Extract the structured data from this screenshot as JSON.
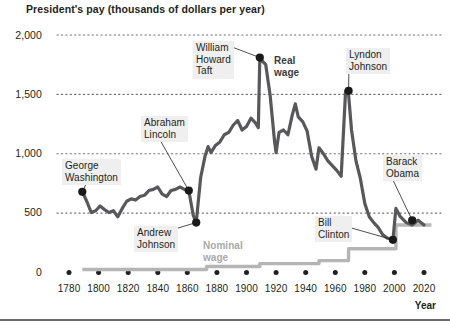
{
  "chart_data": {
    "type": "line",
    "title": "President's pay (thousands of dollars per year)",
    "xlabel": "Year",
    "ylabel": "",
    "xlim": [
      1780,
      2025
    ],
    "ylim": [
      0,
      2100
    ],
    "grid": "horizontal dotted",
    "legend": "inline annotations",
    "y_ticks": [
      "0",
      "500",
      "1,000",
      "1,500",
      "2,000"
    ],
    "y_tick_values": [
      0,
      500,
      1000,
      1500,
      2000
    ],
    "x_ticks": [
      "1780",
      "1800",
      "1820",
      "1840",
      "1860",
      "1880",
      "1900",
      "1920",
      "1940",
      "1960",
      "1980",
      "2000",
      "2020"
    ],
    "x_tick_values": [
      1780,
      1800,
      1820,
      1840,
      1860,
      1880,
      1900,
      1920,
      1940,
      1960,
      1980,
      2000,
      2020
    ],
    "series": [
      {
        "name": "Real wage",
        "color": "#58585a",
        "x": [
          1789,
          1792,
          1795,
          1798,
          1801,
          1804,
          1807,
          1810,
          1813,
          1816,
          1819,
          1822,
          1825,
          1828,
          1831,
          1834,
          1837,
          1840,
          1843,
          1846,
          1849,
          1852,
          1855,
          1858,
          1861,
          1864,
          1866,
          1869,
          1872,
          1874,
          1876,
          1879,
          1882,
          1885,
          1888,
          1891,
          1894,
          1897,
          1900,
          1903,
          1906,
          1908,
          1909,
          1910,
          1913,
          1916,
          1919,
          1920,
          1922,
          1925,
          1928,
          1931,
          1933,
          1935,
          1938,
          1941,
          1944,
          1947,
          1949,
          1952,
          1955,
          1958,
          1961,
          1964,
          1967,
          1969,
          1971,
          1974,
          1977,
          1980,
          1983,
          1986,
          1989,
          1992,
          1995,
          1999,
          2001,
          2004,
          2008,
          2012,
          2016,
          2020
        ],
        "values": [
          680,
          600,
          505,
          520,
          560,
          530,
          505,
          520,
          470,
          540,
          600,
          620,
          610,
          640,
          650,
          690,
          700,
          720,
          660,
          640,
          690,
          700,
          720,
          700,
          690,
          480,
          420,
          800,
          980,
          1060,
          1010,
          1070,
          1100,
          1160,
          1180,
          1240,
          1280,
          1200,
          1230,
          1300,
          1260,
          1220,
          1810,
          1790,
          1750,
          1490,
          1100,
          1010,
          1180,
          1200,
          1160,
          1330,
          1420,
          1310,
          1270,
          1190,
          980,
          870,
          1050,
          1000,
          940,
          900,
          860,
          810,
          1530,
          1500,
          1200,
          940,
          790,
          580,
          470,
          420,
          380,
          320,
          290,
          275,
          540,
          470,
          420,
          400,
          440,
          400
        ]
      },
      {
        "name": "Nominal wage",
        "color": "#b5b5b5",
        "step_years": [
          1789,
          1873,
          1909,
          1949,
          1969,
          2001,
          2025
        ],
        "step_values": [
          25,
          50,
          75,
          100,
          200,
          400,
          400
        ]
      }
    ],
    "annotations": [
      {
        "id": "george-washington",
        "label": "George\nWashington",
        "year": 1789,
        "value": 680
      },
      {
        "id": "andrew-johnson",
        "label": "Andrew\nJohnson",
        "year": 1866,
        "value": 420
      },
      {
        "id": "abraham-lincoln",
        "label": "Abraham\nLincoln",
        "year": 1861,
        "value": 690
      },
      {
        "id": "william-howard-taft",
        "label": "William\nHoward\nTaft",
        "year": 1909,
        "value": 1810
      },
      {
        "id": "lyndon-johnson",
        "label": "Lyndon\nJohnson",
        "year": 1969,
        "value": 1530
      },
      {
        "id": "bill-clinton",
        "label": "Bill\nClinton",
        "year": 1999,
        "value": 275
      },
      {
        "id": "barack-obama",
        "label": "Barack\nObama",
        "year": 2012,
        "value": 440
      }
    ],
    "series_labels": [
      {
        "id": "real-wage-label",
        "text": "Real\nwage",
        "color": "#3a3a3a"
      },
      {
        "id": "nominal-wage-label",
        "text": "Nominal\nwage",
        "color": "#a9a9a9"
      }
    ],
    "colors": {
      "real_wage": "#58585a",
      "nominal_wage": "#b5b5b5",
      "gridline": "#6f6f6f",
      "callout_bg": "#efefef",
      "text": "#231f20",
      "rule": "#6b6b6b"
    }
  }
}
